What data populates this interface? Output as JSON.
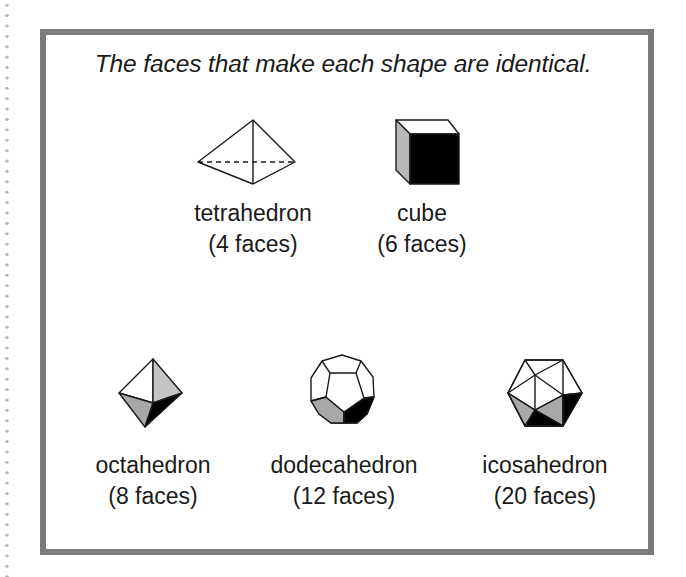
{
  "title": "The faces that make each shape are identical.",
  "colors": {
    "border": "#7a7a7a",
    "stroke": "#1a1a1a",
    "face_white": "#ffffff",
    "face_light_gray": "#c4c4c4",
    "face_gray": "#a8a8a8",
    "face_black": "#000000"
  },
  "shapes": [
    {
      "id": "tetrahedron",
      "name": "tetrahedron",
      "faces_label": "(4 faces)",
      "faces": 4
    },
    {
      "id": "cube",
      "name": "cube",
      "faces_label": "(6 faces)",
      "faces": 6
    },
    {
      "id": "octahedron",
      "name": "octahedron",
      "faces_label": "(8 faces)",
      "faces": 8
    },
    {
      "id": "dodecahedron",
      "name": "dodecahedron",
      "faces_label": "(12 faces)",
      "faces": 12
    },
    {
      "id": "icosahedron",
      "name": "icosahedron",
      "faces_label": "(20 faces)",
      "faces": 20
    }
  ]
}
